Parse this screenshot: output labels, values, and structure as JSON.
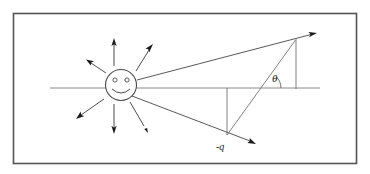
{
  "figure": {
    "name": "point-charge-field-diagram",
    "title": "",
    "background_color": "#ffffff",
    "border": {
      "color": "#555555",
      "x": 13,
      "y": 13,
      "width": 344,
      "height": 151,
      "stroke_width": 1.6
    },
    "labels": {
      "theta": "θ",
      "charge": "-q"
    },
    "source": {
      "name": "smiley-point-charge",
      "cx": 121,
      "cy": 85,
      "r": 15,
      "stroke_color": "#4a4a4a"
    },
    "axis": {
      "name": "horizontal-axis",
      "x1": 50,
      "y1": 88,
      "x2": 320,
      "y2": 88,
      "color": "#8a8a8a"
    },
    "rays": [
      {
        "name": "ray-up",
        "x1": 114,
        "y1": 66,
        "x2": 114,
        "y2": 40
      },
      {
        "name": "ray-up-right",
        "x1": 135,
        "y1": 70,
        "x2": 152,
        "y2": 47
      },
      {
        "name": "ray-up-left",
        "x1": 106,
        "y1": 72,
        "x2": 87,
        "y2": 60
      },
      {
        "name": "ray-down-left",
        "x1": 103,
        "y1": 99,
        "x2": 76,
        "y2": 119
      },
      {
        "name": "ray-down",
        "x1": 114,
        "y1": 105,
        "x2": 114,
        "y2": 134
      },
      {
        "name": "ray-down-right",
        "x1": 130,
        "y1": 103,
        "x2": 148,
        "y2": 133
      }
    ],
    "vectors": [
      {
        "name": "upper-field-vector",
        "x1": 137,
        "y1": 80,
        "x2": 316,
        "y2": 33
      },
      {
        "name": "lower-field-vector",
        "x1": 131,
        "y1": 95,
        "x2": 255,
        "y2": 144
      }
    ],
    "construction_lines": [
      {
        "name": "hypotenuse-to-charge",
        "x1": 295,
        "y1": 40,
        "x2": 227,
        "y2": 135
      },
      {
        "name": "vertical-drop-right",
        "x1": 296,
        "y1": 40,
        "x2": 296,
        "y2": 89
      },
      {
        "name": "vertical-drop-charge",
        "x1": 227,
        "y1": 88,
        "x2": 227,
        "y2": 135
      }
    ],
    "angle": {
      "name": "theta-angle",
      "vertex_x": 265,
      "vertex_y": 88,
      "label_x": 273,
      "label_y": 81,
      "arc_radius": 15
    },
    "charge_label_position": {
      "x": 222,
      "y": 148
    }
  }
}
